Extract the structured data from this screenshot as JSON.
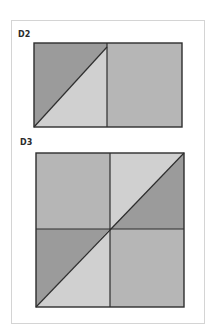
{
  "figures": [
    {
      "label": "D2",
      "description": "Rectangle split into two halves; left half divided diagonally into a dark upper-left triangle and a light lower-right triangle; right half medium gray"
    },
    {
      "label": "D3",
      "description": "Square split into four quadrants; top-left and bottom-right medium gray; top-right and bottom-left divided by a continuous diagonal from bottom-left to top-right corner into light and dark triangles"
    }
  ],
  "colors": {
    "dark": "#9b9b9b",
    "medium": "#b6b6b6",
    "light": "#d0d0d0",
    "stroke": "#2e2e2e",
    "card_border": "#d4d4d4"
  }
}
